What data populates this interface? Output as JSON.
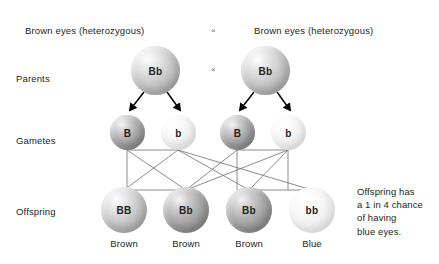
{
  "diagram": {
    "title_left": "Brown eyes (heterozygous)",
    "title_right": "Brown eyes (heterozygous)",
    "cross_symbol_top": "×",
    "cross_symbol_mid": "×",
    "row_labels": {
      "parents": "Parents",
      "gametes": "Gametes",
      "offspring": "Offspring"
    },
    "parents": [
      {
        "genotype": "Bb",
        "shade": "light"
      },
      {
        "genotype": "Bb",
        "shade": "light"
      }
    ],
    "gametes": [
      {
        "allele": "B",
        "shade": "mid"
      },
      {
        "allele": "b",
        "shade": "pale"
      },
      {
        "allele": "B",
        "shade": "mid"
      },
      {
        "allele": "b",
        "shade": "pale"
      }
    ],
    "offspring": [
      {
        "genotype": "BB",
        "phenotype": "Brown",
        "shade": "light"
      },
      {
        "genotype": "Bb",
        "phenotype": "Brown",
        "shade": "mid"
      },
      {
        "genotype": "Bb",
        "phenotype": "Brown",
        "shade": "mid"
      },
      {
        "genotype": "bb",
        "phenotype": "Blue",
        "shade": "pale"
      }
    ],
    "note_lines": [
      "Offspring has",
      "a 1 in 4 chance",
      "of having",
      "blue eyes."
    ],
    "colors": {
      "text": "#231f20",
      "line": "#6d6e71",
      "arrow": "#000000",
      "background": "#ffffff"
    }
  }
}
